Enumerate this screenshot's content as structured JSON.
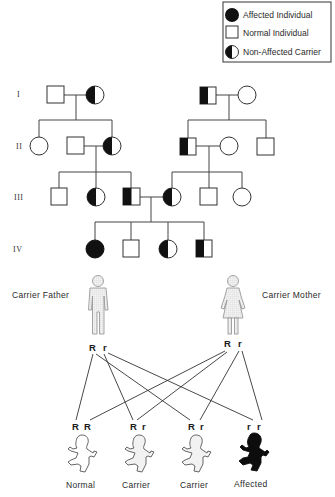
{
  "legend": {
    "items": [
      {
        "symbol": "filled-circle",
        "label": "Affected  Individual"
      },
      {
        "symbol": "empty-square",
        "label": "Normal  Individual"
      },
      {
        "symbol": "half-filled-circle",
        "label": "Non-Affected  Carrier"
      }
    ]
  },
  "pedigree": {
    "generations": [
      "I",
      "II",
      "III",
      "IV"
    ],
    "generation_I": {
      "left_couple": [
        {
          "sex": "male",
          "status": "normal"
        },
        {
          "sex": "female",
          "status": "carrier"
        }
      ],
      "right_couple": [
        {
          "sex": "male",
          "status": "carrier"
        },
        {
          "sex": "female",
          "status": "normal"
        }
      ]
    },
    "generation_II": {
      "left_family": [
        {
          "sex": "female",
          "status": "normal"
        },
        {
          "sex": "male",
          "status": "normal",
          "spouse": true
        },
        {
          "sex": "female",
          "status": "carrier"
        }
      ],
      "right_family": [
        {
          "sex": "male",
          "status": "carrier"
        },
        {
          "sex": "female",
          "status": "normal",
          "spouse": true
        },
        {
          "sex": "male",
          "status": "normal"
        }
      ]
    },
    "generation_III": [
      {
        "sex": "male",
        "status": "normal"
      },
      {
        "sex": "female",
        "status": "carrier"
      },
      {
        "sex": "male",
        "status": "carrier"
      },
      {
        "sex": "female",
        "status": "carrier"
      },
      {
        "sex": "male",
        "status": "normal"
      },
      {
        "sex": "female",
        "status": "normal"
      }
    ],
    "generation_IV": [
      {
        "sex": "female",
        "status": "affected"
      },
      {
        "sex": "male",
        "status": "normal"
      },
      {
        "sex": "female",
        "status": "carrier"
      },
      {
        "sex": "male",
        "status": "carrier"
      }
    ]
  },
  "punnett": {
    "father_label": "Carrier  Father",
    "mother_label": "Carrier  Mother",
    "father_alleles": [
      "R",
      "r"
    ],
    "mother_alleles": [
      "R",
      "r"
    ],
    "offspring": [
      {
        "alleles": [
          "R",
          "R"
        ],
        "label": "Normal"
      },
      {
        "alleles": [
          "R",
          "r"
        ],
        "label": "Carrier"
      },
      {
        "alleles": [
          "R",
          "r"
        ],
        "label": "Carrier"
      },
      {
        "alleles": [
          "r",
          "r"
        ],
        "label": "Affected"
      }
    ]
  },
  "colors": {
    "affected": "#111111",
    "outline": "#333333",
    "figure_grey": "#9a9a9a",
    "background": "#ffffff"
  }
}
